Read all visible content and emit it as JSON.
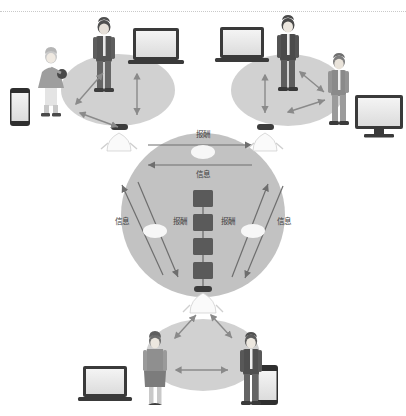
{
  "page": {
    "title_clipped": "区块链 共享经济 生态 示意图",
    "background_color": "#ffffff",
    "divider_color": "#c9c9c9"
  },
  "diagram": {
    "type": "network-ecosystem-diagram",
    "palette": {
      "cluster_fill": "#cccccc",
      "center_fill": "#b8b8b8",
      "arrow_color": "#6e6e6e",
      "block_fill": "#5a5a5a",
      "node_fill": "#f2f2f2",
      "figure_dark": "#5e5e5e",
      "figure_light": "#bdbdbd",
      "device_frame": "#3a3a3a",
      "device_screen": "#e8e8e8"
    },
    "center": {
      "name": "blockchain-core",
      "blocks_count": 4,
      "block_label": "区块"
    },
    "clusters": [
      {
        "id": "top-left",
        "name": "cluster-top-left",
        "figures": [
          "business-man",
          "seated-woman"
        ],
        "devices": [
          "laptop",
          "smartphone"
        ],
        "arrows": 3
      },
      {
        "id": "top-right",
        "name": "cluster-top-right",
        "figures": [
          "business-man",
          "business-man-2"
        ],
        "devices": [
          "laptop",
          "monitor"
        ],
        "arrows": 3
      },
      {
        "id": "bottom",
        "name": "cluster-bottom",
        "figures": [
          "woman",
          "man"
        ],
        "devices": [
          "laptop",
          "smartphone"
        ],
        "arrows": 3
      }
    ],
    "nodes": [
      {
        "id": "node-left",
        "name": "node-agent-left"
      },
      {
        "id": "node-right",
        "name": "node-agent-right"
      },
      {
        "id": "node-bottom",
        "name": "node-agent-bottom"
      }
    ],
    "edge_labels": {
      "reward": "报酬",
      "information": "信息"
    },
    "edges": [
      {
        "id": "top-reward",
        "label": "报酬",
        "direction": "right",
        "position": "top-inside"
      },
      {
        "id": "top-information",
        "label": "信息",
        "direction": "left",
        "position": "top-inside-lower"
      },
      {
        "id": "left-information",
        "label": "信息",
        "direction": "up-left",
        "position": "left-outer"
      },
      {
        "id": "left-reward",
        "label": "报酬",
        "direction": "down-right",
        "position": "left-inner"
      },
      {
        "id": "right-reward",
        "label": "报酬",
        "direction": "up-right",
        "position": "right-inner"
      },
      {
        "id": "right-information",
        "label": "信息",
        "direction": "down-left",
        "position": "right-outer"
      }
    ]
  }
}
